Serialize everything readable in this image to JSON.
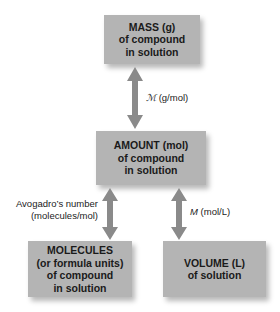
{
  "diagram": {
    "nodes": {
      "mass": {
        "line1": "MASS (g)",
        "line2": "of compound",
        "line3": "in solution"
      },
      "amount": {
        "line1": "AMOUNT (mol)",
        "line2": "of compound",
        "line3": "in solution"
      },
      "molecules": {
        "line1": "MOLECULES",
        "line2": "(or formula units)",
        "line3": "of compound",
        "line4": "in solution"
      },
      "volume": {
        "line1": "VOLUME (L)",
        "line2": "of solution"
      }
    },
    "edges": {
      "mass_amount": {
        "symbol": "ℳ",
        "unit": "(g/mol)"
      },
      "amount_molecules": {
        "line1": "Avogadro’s number",
        "line2": "(molecules/mol)"
      },
      "amount_volume": {
        "symbol": "M",
        "unit": "(mol/L)"
      }
    },
    "colors": {
      "box": "#b4b4b4",
      "arrow": "#8a8a8a",
      "text": "#1a1a1a"
    }
  }
}
